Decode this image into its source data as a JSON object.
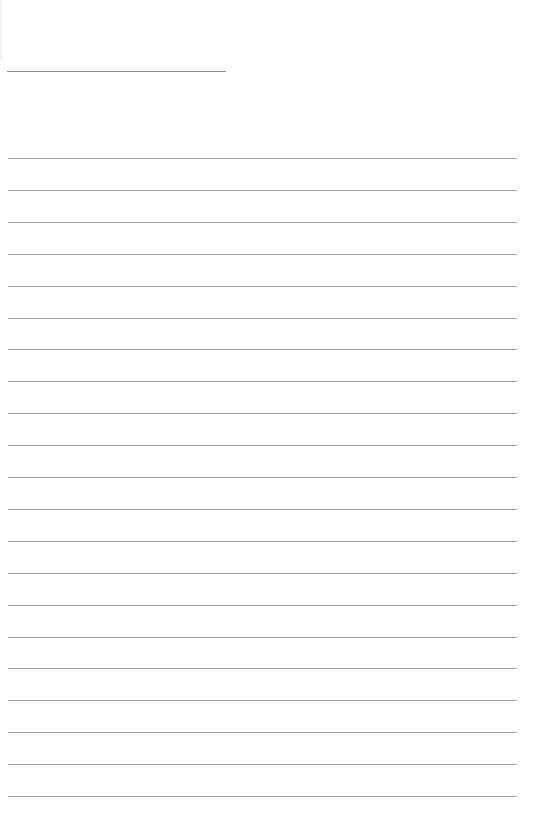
{
  "page": {
    "type": "blank-lined-sheet",
    "background_color": "#ffffff",
    "line_color": "#a3a3a3",
    "header_line": {
      "label": "",
      "top": 71,
      "left": 7,
      "width": 219
    },
    "ruled_lines": {
      "count": 21,
      "first_top": 158,
      "spacing": 31.9,
      "left": 8,
      "width": 509,
      "texts": [
        "",
        "",
        "",
        "",
        "",
        "",
        "",
        "",
        "",
        "",
        "",
        "",
        "",
        "",
        "",
        "",
        "",
        "",
        "",
        "",
        ""
      ]
    }
  }
}
